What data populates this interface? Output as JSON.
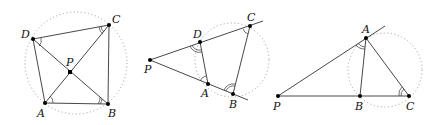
{
  "figures": [
    {
      "id": "cyclic-quadrilateral-diagonals",
      "description": "Cyclic quadrilateral ABCD with diagonals intersecting at P; equal inscribed angles marked",
      "points": {
        "A": {
          "label": "A",
          "x": 45,
          "y": 103
        },
        "B": {
          "label": "B",
          "x": 108,
          "y": 104
        },
        "C": {
          "label": "C",
          "x": 109,
          "y": 25
        },
        "D": {
          "label": "D",
          "x": 33,
          "y": 39
        },
        "P": {
          "label": "P",
          "x": 70,
          "y": 72
        }
      },
      "circle": {
        "cx": 76,
        "cy": 63,
        "r": 51
      }
    },
    {
      "id": "secants-from-external-point",
      "description": "Two secants from P through D,C and A,B of a circle; equal angles marked",
      "points": {
        "P": {
          "label": "P",
          "x": 150,
          "y": 60
        },
        "D": {
          "label": "D",
          "x": 200,
          "y": 42
        },
        "C": {
          "label": "C",
          "x": 250,
          "y": 26
        },
        "A": {
          "label": "A",
          "x": 208,
          "y": 84
        },
        "B": {
          "label": "B",
          "x": 233,
          "y": 94
        }
      },
      "circle": {
        "cx": 232,
        "cy": 60,
        "r": 37
      }
    },
    {
      "id": "tangent-secant",
      "description": "Tangent PA and secant PBC; tangent-chord angle equals inscribed angle",
      "points": {
        "P": {
          "label": "P",
          "x": 278,
          "y": 96
        },
        "A": {
          "label": "A",
          "x": 366,
          "y": 38
        },
        "B": {
          "label": "B",
          "x": 360,
          "y": 96
        },
        "C": {
          "label": "C",
          "x": 409,
          "y": 96
        }
      },
      "circle": {
        "cx": 385,
        "cy": 70,
        "r": 37
      }
    }
  ],
  "labels": {
    "f1": {
      "A": "A",
      "B": "B",
      "C": "C",
      "D": "D",
      "P": "P"
    },
    "f2": {
      "A": "A",
      "B": "B",
      "C": "C",
      "D": "D",
      "P": "P"
    },
    "f3": {
      "A": "A",
      "B": "B",
      "C": "C",
      "P": "P"
    }
  },
  "colors": {
    "line": "#333333",
    "circle": "#999999",
    "point": "#000000"
  }
}
